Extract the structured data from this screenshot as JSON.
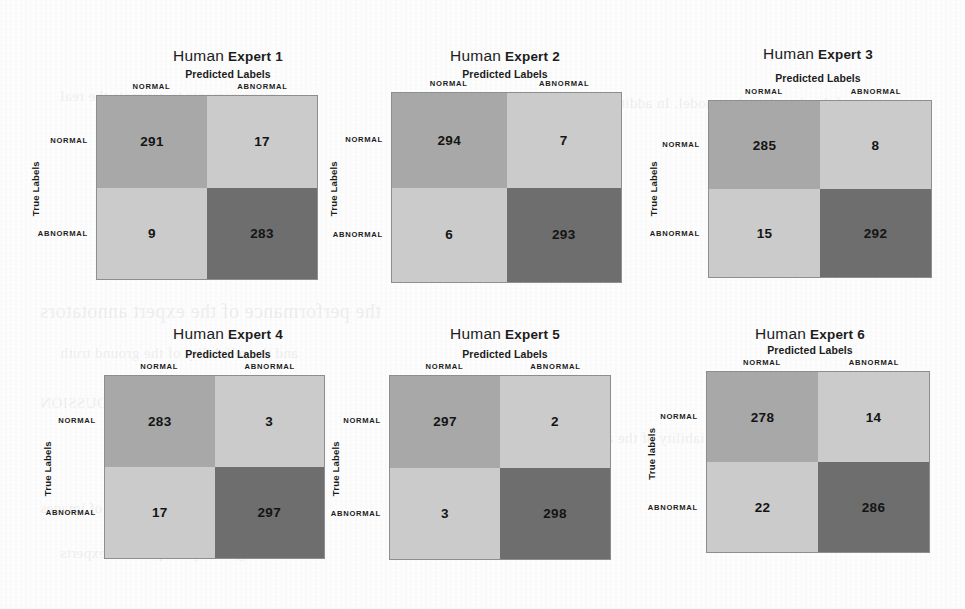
{
  "page": {
    "background_color": "#fdfdfd",
    "ghost_lines": [
      "measurements to estimate the real",
      "of the deep learning model. In addition",
      "the performance of the expert annotators",
      "and the reliability of the ground truth",
      "OUSSION",
      "reliability of the annotators and",
      "against the same set of images",
      "labels agreed by the panel of experts"
    ]
  },
  "colors": {
    "cell_true_negative": "#a8a8a8",
    "cell_off_diagonal": "#cbcbcb",
    "cell_true_positive": "#6e6e6e",
    "grid_border": "#8e8e8e",
    "text": "#1c1c1c"
  },
  "chart_data": {
    "type": "heatmap",
    "subtype": "confusion-matrix-grid",
    "title": "",
    "xlabel": "Predicted Labels",
    "ylabel": "True Labels",
    "class_labels": [
      "NORMAL",
      "ABNORMAL"
    ],
    "grid_layout": {
      "rows": 2,
      "cols": 3
    },
    "value_scale_note": "Darker cells = diagonal (correct) counts; lighter cells = off-diagonal (error) counts",
    "panels": [
      {
        "id": "expert-1",
        "title_primary": "Human",
        "title_secondary": "Expert 1",
        "xlabel": "Predicted Labels",
        "ylabel": "True Labels",
        "row_labels": [
          "NORMAL",
          "ABNORMAL"
        ],
        "col_labels": [
          "NORMAL",
          "ABNORMAL"
        ],
        "matrix": [
          [
            291,
            17
          ],
          [
            9,
            283
          ]
        ],
        "true_negative": 291,
        "false_positive": 17,
        "false_negative": 9,
        "true_positive": 283,
        "total": 600
      },
      {
        "id": "expert-2",
        "title_primary": "Human",
        "title_secondary": "Expert 2",
        "xlabel": "Predicted Labels",
        "ylabel": "True Labels",
        "row_labels": [
          "NORMAL",
          "ABNORMAL"
        ],
        "col_labels": [
          "NORMAL",
          "ABNORMAL"
        ],
        "matrix": [
          [
            294,
            7
          ],
          [
            6,
            293
          ]
        ],
        "true_negative": 294,
        "false_positive": 7,
        "false_negative": 6,
        "true_positive": 293,
        "total": 600
      },
      {
        "id": "expert-3",
        "title_primary": "Human",
        "title_secondary": "Expert 3",
        "xlabel": "Predicted Labels",
        "ylabel": "True Labels",
        "row_labels": [
          "NORMAL",
          "ABNORMAL"
        ],
        "col_labels": [
          "NORMAL",
          "ABNORMAL"
        ],
        "matrix": [
          [
            285,
            8
          ],
          [
            15,
            292
          ]
        ],
        "true_negative": 285,
        "false_positive": 8,
        "false_negative": 15,
        "true_positive": 292,
        "total": 600
      },
      {
        "id": "expert-4",
        "title_primary": "Human",
        "title_secondary": "Expert 4",
        "xlabel": "Predicted Labels",
        "ylabel": "True Labels",
        "row_labels": [
          "NORMAL",
          "ABNORMAL"
        ],
        "col_labels": [
          "NORMAL",
          "ABNORMAL"
        ],
        "matrix": [
          [
            283,
            3
          ],
          [
            17,
            297
          ]
        ],
        "true_negative": 283,
        "false_positive": 3,
        "false_negative": 17,
        "true_positive": 297,
        "total": 600
      },
      {
        "id": "expert-5",
        "title_primary": "Human",
        "title_secondary": "Expert 5",
        "xlabel": "Predicted Labels",
        "ylabel": "True Labels",
        "row_labels": [
          "NORMAL",
          "ABNORMAL"
        ],
        "col_labels": [
          "NORMAL",
          "ABNORMAL"
        ],
        "matrix": [
          [
            297,
            2
          ],
          [
            3,
            298
          ]
        ],
        "true_negative": 297,
        "false_positive": 2,
        "false_negative": 3,
        "true_positive": 298,
        "total": 600
      },
      {
        "id": "expert-6",
        "title_primary": "Human",
        "title_secondary": "Expert 6",
        "xlabel": "Predicted Labels",
        "ylabel": "True labels",
        "row_labels": [
          "NORMAL",
          "ABNORMAL"
        ],
        "col_labels": [
          "NORMAL",
          "ABNORMAL"
        ],
        "matrix": [
          [
            278,
            14
          ],
          [
            22,
            286
          ]
        ],
        "true_negative": 278,
        "false_positive": 14,
        "false_negative": 22,
        "true_positive": 286,
        "total": 600
      }
    ]
  }
}
